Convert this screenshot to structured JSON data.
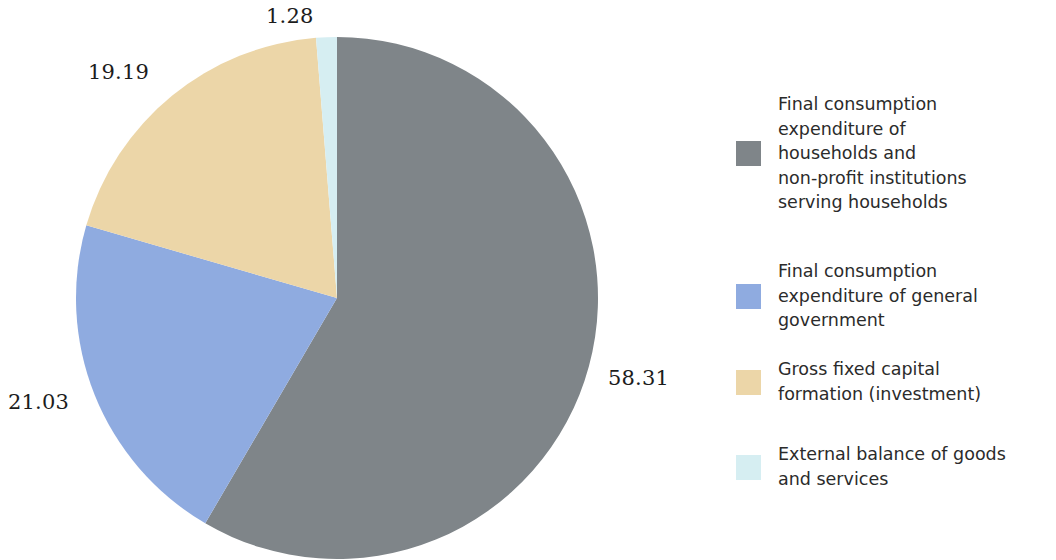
{
  "chart_data": {
    "type": "pie",
    "title": "",
    "subtitle": "",
    "xlabel": "",
    "ylabel": "",
    "legend_position": "right",
    "grid": false,
    "units": "percent",
    "categories": [
      "Final consumption\nexpenditure of\nhouseholds and\nnon-profit institutions\nserving households",
      "Final consumption\nexpenditure of general\ngovernment",
      "Gross fixed capital\nformation (investment)",
      "External balance of goods\nand services"
    ],
    "values": [
      58.31,
      21.03,
      19.19,
      1.28
    ],
    "value_labels": [
      "58.31",
      "21.03",
      "19.19",
      "1.28"
    ],
    "colors": [
      "#7f8589",
      "#8fabe0",
      "#ecd6a8",
      "#d6eef2"
    ],
    "slices": [
      {
        "label": "Final consumption expenditure of households and non-profit institutions serving households",
        "value": 58.31,
        "value_label": "58.31",
        "color": "#7f8589"
      },
      {
        "label": "Final consumption expenditure of general government",
        "value": 21.03,
        "value_label": "21.03",
        "color": "#8fabe0"
      },
      {
        "label": "Gross fixed capital formation (investment)",
        "value": 19.19,
        "value_label": "19.19",
        "color": "#ecd6a8"
      },
      {
        "label": "External balance of goods and services",
        "value": 1.28,
        "value_label": "1.28",
        "color": "#d6eef2"
      }
    ]
  },
  "pie": {
    "labels": {
      "household": "58.31",
      "government": "21.03",
      "gfcf": "19.19",
      "external": "1.28"
    }
  },
  "legend": {
    "items": [
      {
        "label": "Final consumption\nexpenditure of\nhouseholds and\nnon-profit institutions\nserving households",
        "color": "#7f8589"
      },
      {
        "label": "Final consumption\nexpenditure of general\ngovernment",
        "color": "#8fabe0"
      },
      {
        "label": "Gross fixed capital\nformation (investment)",
        "color": "#ecd6a8"
      },
      {
        "label": "External balance of goods\nand services",
        "color": "#d6eef2"
      }
    ]
  }
}
